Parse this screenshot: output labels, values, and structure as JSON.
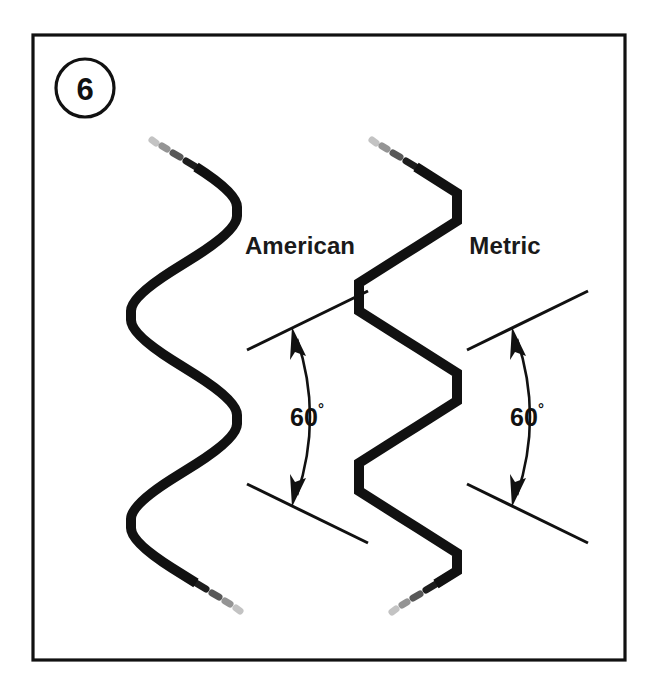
{
  "figure": {
    "number": "6",
    "background_color": "#ffffff",
    "line_color": "#111111",
    "frame": {
      "x": 33,
      "y": 35,
      "width": 592,
      "height": 625
    },
    "badge": {
      "cx": 85,
      "cy": 88,
      "r": 29
    }
  },
  "profiles": [
    {
      "id": "american",
      "label": "American",
      "label_x": 300,
      "label_y": 245,
      "crest_style": "rounded",
      "crest_x": 237,
      "root_x": 131,
      "top_y": 143,
      "bottom_y": 605,
      "stroke_width": 10
    },
    {
      "id": "metric",
      "label": "Metric",
      "label_x": 505,
      "label_y": 245,
      "crest_style": "sharp-flat",
      "crest_x": 457,
      "root_x": 359,
      "top_y": 143,
      "bottom_y": 605,
      "stroke_width": 10
    }
  ],
  "annotations": [
    {
      "id": "angle-american",
      "value": "60",
      "unit": "°",
      "label_x": 307,
      "label_y": 417,
      "vertex_x": 237,
      "vertex_y": 417,
      "upper_line": {
        "x1": 247,
        "y1": 350,
        "x2": 368,
        "y2": 291
      },
      "lower_line": {
        "x1": 247,
        "y1": 484,
        "x2": 368,
        "y2": 543
      },
      "arc_radius": 92
    },
    {
      "id": "angle-metric",
      "value": "60",
      "unit": "°",
      "label_x": 527,
      "label_y": 417,
      "vertex_x": 457,
      "vertex_y": 417,
      "upper_line": {
        "x1": 467,
        "y1": 350,
        "x2": 588,
        "y2": 291
      },
      "lower_line": {
        "x1": 467,
        "y1": 484,
        "x2": 588,
        "y2": 543
      },
      "arc_radius": 92
    }
  ],
  "thread_angle_degrees": 60
}
